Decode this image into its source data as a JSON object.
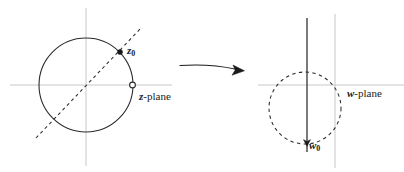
{
  "figure": {
    "width": 404,
    "height": 172,
    "background_color": "#ffffff"
  },
  "colors": {
    "curve_stroke": "#2b2b2b",
    "axis_stroke": "#c8c8c8",
    "arrow_stroke": "#1a1a1a",
    "text": "#1a1a1a",
    "marker_fill": "#1a1a1a",
    "marker_hollow_fill": "#ffffff"
  },
  "left_panel": {
    "name": "z-plane",
    "plane_label": {
      "variable": "z",
      "suffix": "-plane"
    },
    "axes": {
      "horizontal": {
        "y": 85,
        "x_start": 10,
        "x_end": 172
      },
      "vertical": {
        "x": 86,
        "y_start": 8,
        "y_end": 166
      }
    },
    "circle": {
      "style": "solid",
      "center_x": 86,
      "center_y": 85,
      "radius": 47
    },
    "dashed_line": {
      "style": "dashed",
      "x1": 36,
      "y1": 138,
      "x2": 142,
      "y2": 27
    },
    "points": [
      {
        "id": "z0",
        "label_variable": "z",
        "label_subscript": "0",
        "marker": "filled-dot",
        "x": 120,
        "y": 52
      },
      {
        "id": "z-plane-anchor",
        "label_variable": "",
        "label_subscript": "",
        "marker": "hollow-dot",
        "x": 132.5,
        "y": 85
      }
    ]
  },
  "arrow": {
    "name": "mapping-arrow",
    "direction": "right",
    "start_x": 180,
    "start_y": 65,
    "end_x": 244,
    "end_y": 70,
    "curved": true
  },
  "right_panel": {
    "name": "w-plane",
    "plane_label": {
      "variable": "w",
      "suffix": "-plane"
    },
    "axes": {
      "horizontal": {
        "y": 85,
        "x_start": 258,
        "x_end": 404
      },
      "vertical": {
        "x": 335,
        "y_start": 14,
        "y_end": 168
      }
    },
    "circle": {
      "style": "dashed",
      "center_x": 305,
      "center_y": 108,
      "radius": 36
    },
    "vertical_line": {
      "style": "solid",
      "x": 307,
      "y_start": 18,
      "y_end": 152
    },
    "points": [
      {
        "id": "w0",
        "label_variable": "w",
        "label_subscript": "0",
        "marker": "arrowhead-down",
        "x": 307,
        "y": 143
      }
    ]
  }
}
